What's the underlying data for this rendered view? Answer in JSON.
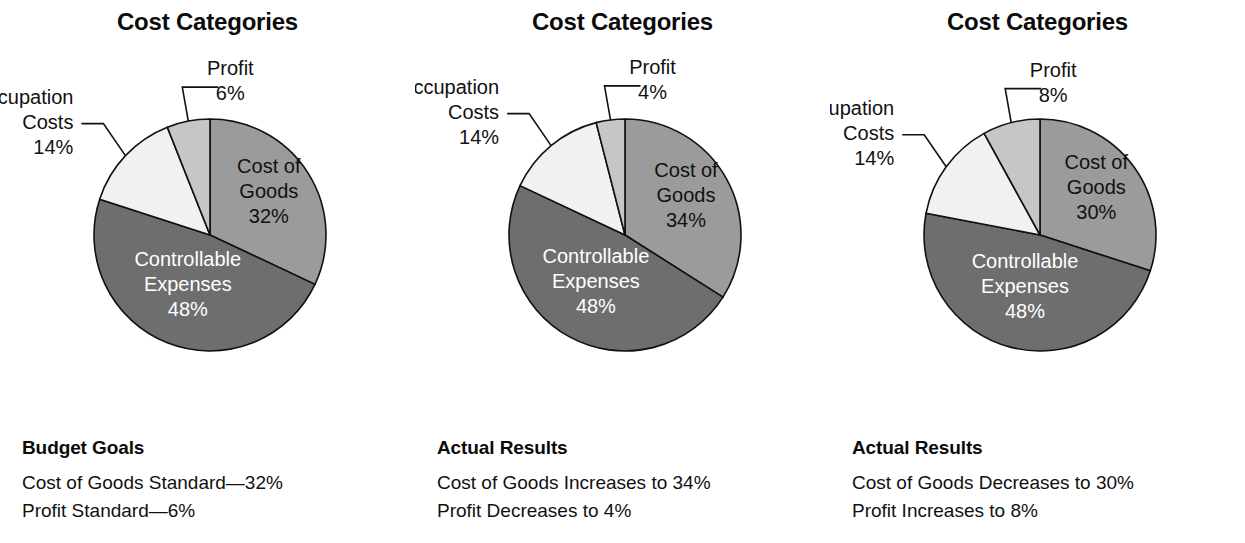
{
  "figure": {
    "width": 1245,
    "height": 543,
    "background": "#ffffff"
  },
  "palette": {
    "cost_of_goods": "#9b9b9b",
    "controllable_expenses": "#6e6e6e",
    "occupation_costs": "#f1f1f1",
    "profit": "#c6c6c6",
    "outline": "#111111",
    "text_dark": "#111111",
    "text_light": "#ffffff"
  },
  "chart_data": [
    {
      "type": "pie",
      "title": "Cost Categories",
      "legend": "none",
      "start_angle_deg": 0,
      "direction": "clockwise",
      "categories": [
        "Cost of Goods",
        "Controllable Expenses",
        "Occupation Costs",
        "Profit"
      ],
      "values": [
        32,
        48,
        14,
        6
      ],
      "slices": [
        {
          "name": "Cost of Goods",
          "value": 32,
          "value_label": "32%",
          "label_line1": "Cost of",
          "label_line2": "Goods",
          "color": "#9b9b9b",
          "label_placement": "inside",
          "text_color": "dark"
        },
        {
          "name": "Controllable Expenses",
          "value": 48,
          "value_label": "48%",
          "label_line1": "Controllable",
          "label_line2": "Expenses",
          "color": "#6e6e6e",
          "label_placement": "inside",
          "text_color": "light"
        },
        {
          "name": "Occupation Costs",
          "value": 14,
          "value_label": "14%",
          "label_line1": "Occupation",
          "label_line2": "Costs",
          "color": "#f1f1f1",
          "label_placement": "callout",
          "text_color": "dark"
        },
        {
          "name": "Profit",
          "value": 6,
          "value_label": "6%",
          "label_line1": "Profit",
          "label_line2": "",
          "color": "#c6c6c6",
          "label_placement": "callout",
          "text_color": "dark"
        }
      ],
      "caption": {
        "heading": "Budget Goals",
        "lines": [
          "Cost of Goods Standard—32%",
          "Profit Standard—6%"
        ]
      }
    },
    {
      "type": "pie",
      "title": "Cost Categories",
      "legend": "none",
      "start_angle_deg": 0,
      "direction": "clockwise",
      "categories": [
        "Cost of Goods",
        "Controllable Expenses",
        "Occupation Costs",
        "Profit"
      ],
      "values": [
        34,
        48,
        14,
        4
      ],
      "slices": [
        {
          "name": "Cost of Goods",
          "value": 34,
          "value_label": "34%",
          "label_line1": "Cost of",
          "label_line2": "Goods",
          "color": "#9b9b9b",
          "label_placement": "inside",
          "text_color": "dark"
        },
        {
          "name": "Controllable Expenses",
          "value": 48,
          "value_label": "48%",
          "label_line1": "Controllable",
          "label_line2": "Expenses",
          "color": "#6e6e6e",
          "label_placement": "inside",
          "text_color": "light"
        },
        {
          "name": "Occupation Costs",
          "value": 14,
          "value_label": "14%",
          "label_line1": "Occupation",
          "label_line2": "Costs",
          "color": "#f1f1f1",
          "label_placement": "callout",
          "text_color": "dark"
        },
        {
          "name": "Profit",
          "value": 4,
          "value_label": "4%",
          "label_line1": "Profit",
          "label_line2": "",
          "color": "#c6c6c6",
          "label_placement": "callout",
          "text_color": "dark"
        }
      ],
      "caption": {
        "heading": "Actual Results",
        "lines": [
          "Cost of Goods Increases to 34%",
          "Profit Decreases to 4%"
        ]
      }
    },
    {
      "type": "pie",
      "title": "Cost Categories",
      "legend": "none",
      "start_angle_deg": 0,
      "direction": "clockwise",
      "categories": [
        "Cost of Goods",
        "Controllable Expenses",
        "Occupation Costs",
        "Profit"
      ],
      "values": [
        30,
        48,
        14,
        8
      ],
      "slices": [
        {
          "name": "Cost of Goods",
          "value": 30,
          "value_label": "30%",
          "label_line1": "Cost of",
          "label_line2": "Goods",
          "color": "#9b9b9b",
          "label_placement": "inside",
          "text_color": "dark"
        },
        {
          "name": "Controllable Expenses",
          "value": 48,
          "value_label": "48%",
          "label_line1": "Controllable",
          "label_line2": "Expenses",
          "color": "#6e6e6e",
          "label_placement": "inside",
          "text_color": "light"
        },
        {
          "name": "Occupation Costs",
          "value": 14,
          "value_label": "14%",
          "label_line1": "Occupation",
          "label_line2": "Costs",
          "color": "#f1f1f1",
          "label_placement": "callout",
          "text_color": "dark"
        },
        {
          "name": "Profit",
          "value": 8,
          "value_label": "8%",
          "label_line1": "Profit",
          "label_line2": "",
          "color": "#c6c6c6",
          "label_placement": "callout",
          "text_color": "dark"
        }
      ],
      "caption": {
        "heading": "Actual Results",
        "lines": [
          "Cost of Goods Decreases to 30%",
          "Profit Increases to 8%"
        ]
      }
    }
  ]
}
